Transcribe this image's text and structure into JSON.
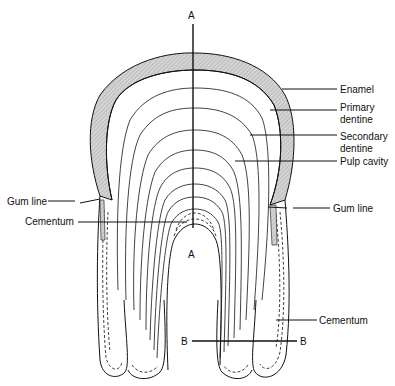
{
  "diagram": {
    "section_markers": {
      "a_top": "A",
      "a_bottom": "A",
      "b_left": "B",
      "b_right": "B"
    },
    "labels": {
      "enamel": "Enamel",
      "primary_dentine_1": "Primary",
      "primary_dentine_2": "dentine",
      "secondary_dentine_1": "Secondary",
      "secondary_dentine_2": "dentine",
      "pulp_cavity": "Pulp cavity",
      "gum_line_left": "Gum line",
      "gum_line_right": "Gum line",
      "cementum_left": "Cementum",
      "cementum_right": "Cementum"
    },
    "colors": {
      "ink": "#111111",
      "enamel_fill": "#c8c8c8",
      "background": "#ffffff"
    }
  }
}
